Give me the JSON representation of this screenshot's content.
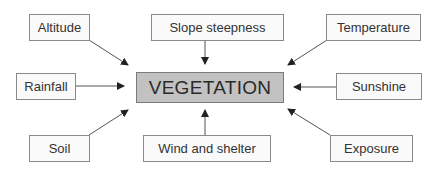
{
  "diagram": {
    "center": {
      "label": "VEGETATION",
      "fill": "#c2c2c2"
    },
    "factors": [
      {
        "id": "altitude",
        "label": "Altitude",
        "position": "top-left"
      },
      {
        "id": "slope",
        "label": "Slope steepness",
        "position": "top"
      },
      {
        "id": "temperature",
        "label": "Temperature",
        "position": "top-right"
      },
      {
        "id": "rainfall",
        "label": "Rainfall",
        "position": "left"
      },
      {
        "id": "sunshine",
        "label": "Sunshine",
        "position": "right"
      },
      {
        "id": "soil",
        "label": "Soil",
        "position": "bottom-left"
      },
      {
        "id": "wind",
        "label": "Wind and shelter",
        "position": "bottom"
      },
      {
        "id": "exposure",
        "label": "Exposure",
        "position": "bottom-right"
      }
    ],
    "arrow_color": "#333333",
    "arrow_direction": "factor-to-center"
  }
}
